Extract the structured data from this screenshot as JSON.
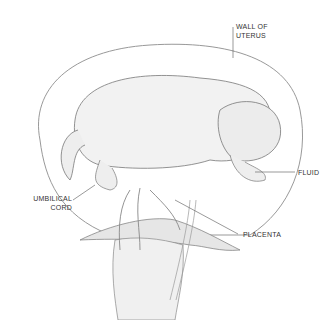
{
  "labels": {
    "wall_line1": "WALL OF",
    "wall_line2": "UTERUS",
    "fluid": "FLUID",
    "cord_line1": "UMBILICAL",
    "cord_line2": "CORD",
    "placenta": "PLACENTA"
  },
  "colors": {
    "line": "#555555",
    "fill": "#f2f2f2",
    "shade": "#dcdcdc"
  }
}
